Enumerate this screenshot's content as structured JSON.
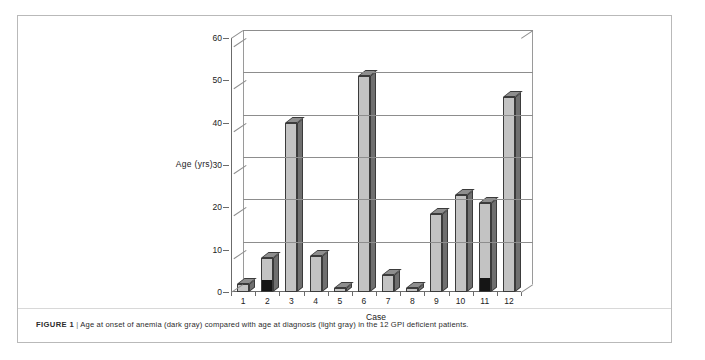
{
  "figure": {
    "caption_label": "FIGURE 1",
    "caption_divider": "|",
    "caption_text": "Age at onset of anemia (dark gray) compared with age at diagnosis (light gray) in the 12 GPI deficient patients."
  },
  "chart_data": {
    "type": "bar",
    "title": "",
    "xlabel": "Case",
    "ylabel": "Age (yrs)",
    "categories": [
      "1",
      "2",
      "3",
      "4",
      "5",
      "6",
      "7",
      "8",
      "9",
      "10",
      "11",
      "12"
    ],
    "yticks": [
      "0",
      "10",
      "20",
      "30",
      "40",
      "50",
      "60"
    ],
    "ylim": [
      0,
      60
    ],
    "grid": true,
    "legend_position": "none",
    "stacked": true,
    "style": "3d-column",
    "series": [
      {
        "name": "Age at onset of anemia (dark gray)",
        "color": "#151515",
        "values": [
          0,
          2.5,
          0,
          0,
          0,
          0,
          0,
          0,
          0,
          0,
          3,
          0
        ]
      },
      {
        "name": "Age at diagnosis (light gray)",
        "color": "#c3c3c3",
        "values": [
          2,
          8,
          40,
          8.5,
          1,
          51,
          4,
          1,
          18.5,
          23,
          21,
          46
        ]
      }
    ]
  },
  "colors": {
    "bar_light": "#c3c3c3",
    "bar_dark": "#151515",
    "bar_top": "#8e8e8e",
    "bar_side": "#6f6f6f",
    "axis": "#6b6b6b",
    "grid": "#8d8d8d",
    "frame": "#b9b9b9",
    "text": "#222222"
  }
}
